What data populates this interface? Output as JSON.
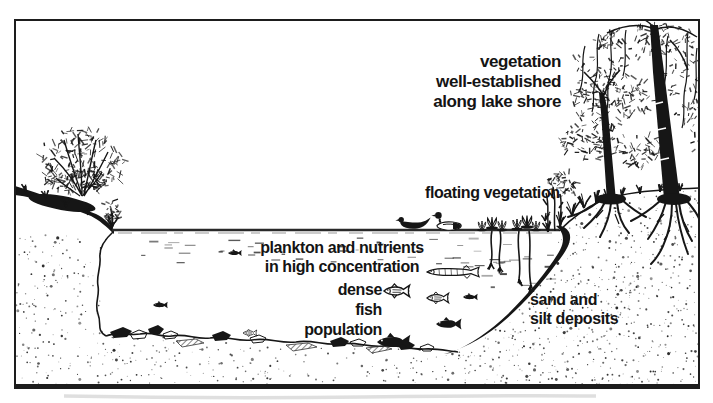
{
  "figure": {
    "colors": {
      "ink": "#161616",
      "background": "#ffffff"
    },
    "labels": {
      "shore_vegetation": "vegetation\nwell-established\nalong lake shore",
      "floating_vegetation": "floating vegetation",
      "plankton": "plankton and nutrients\nin high concentration",
      "dense_fish": "dense\nfish\npopulation",
      "deposits": "sand and\nsilt deposits"
    }
  }
}
